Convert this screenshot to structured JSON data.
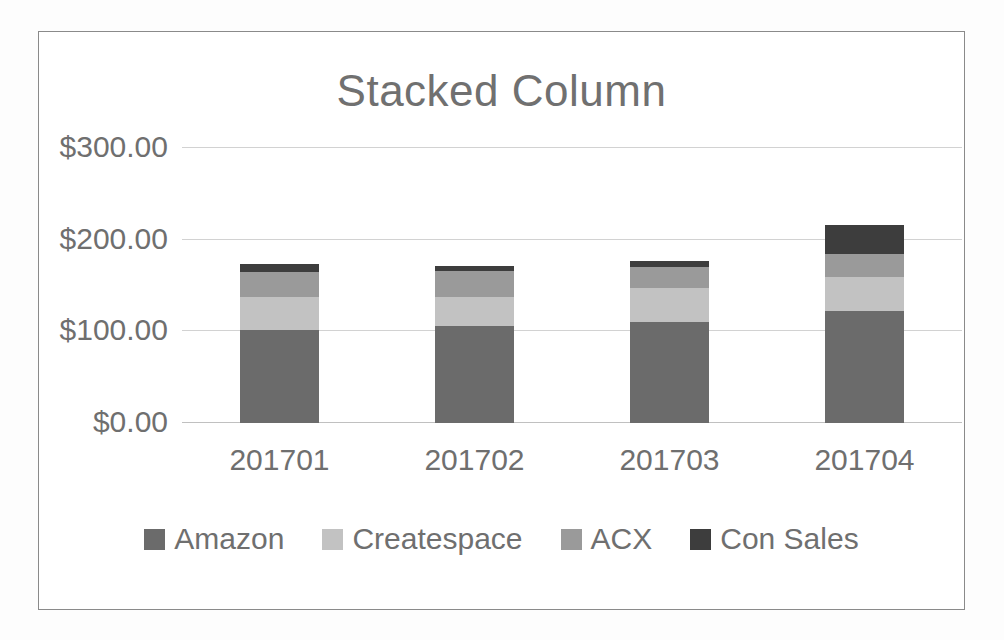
{
  "chart_data": {
    "type": "bar",
    "subtype": "stacked-column",
    "title": "Stacked Column",
    "xlabel": "",
    "ylabel": "",
    "categories": [
      "201701",
      "201702",
      "201703",
      "201704"
    ],
    "series": [
      {
        "name": "Amazon",
        "color": "#6b6b6b",
        "values": [
          101,
          106,
          110,
          122
        ]
      },
      {
        "name": "Createspace",
        "color": "#c2c2c2",
        "values": [
          36,
          32,
          37,
          37
        ]
      },
      {
        "name": "ACX",
        "color": "#9a9a9a",
        "values": [
          28,
          28,
          23,
          25
        ]
      },
      {
        "name": "Con Sales",
        "color": "#3d3d3d",
        "values": [
          8,
          5,
          7,
          32
        ]
      }
    ],
    "totals": [
      173,
      171,
      177,
      216
    ],
    "ylim": [
      0,
      300
    ],
    "y_ticks": [
      0,
      100,
      200,
      300
    ],
    "y_tick_labels": [
      "$0.00",
      "$100.00",
      "$200.00",
      "$300.00"
    ],
    "y_tick_format": "$#,##0.00",
    "grid": true,
    "grid_axis": "y",
    "legend": true,
    "legend_position": "bottom",
    "frame_border_color": "#8a8a8a",
    "plot_background": "#ffffff",
    "text_color": "#6f6f6f",
    "gridline_color": "#d2d2d2"
  }
}
